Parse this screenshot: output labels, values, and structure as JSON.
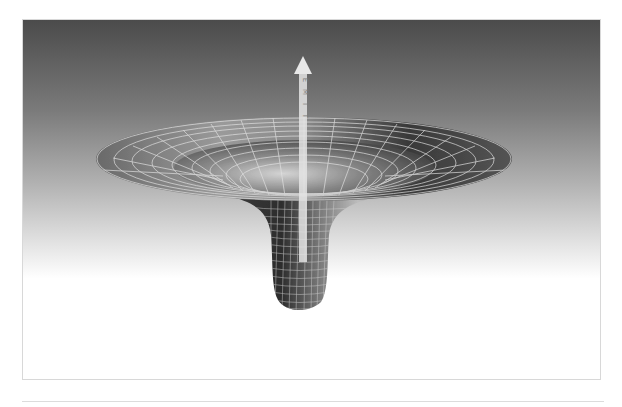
{
  "figure": {
    "arrow_label_letters": [
      "T",
      "I",
      "M",
      "E"
    ],
    "arrow_label": "TIME",
    "colors": {
      "background_top": "#4b4b4b",
      "background_bottom": "#ffffff",
      "grid_line": "#d9d9d9",
      "arrow": "#e6e6e6",
      "frame_border": "#d8d8d8"
    }
  }
}
